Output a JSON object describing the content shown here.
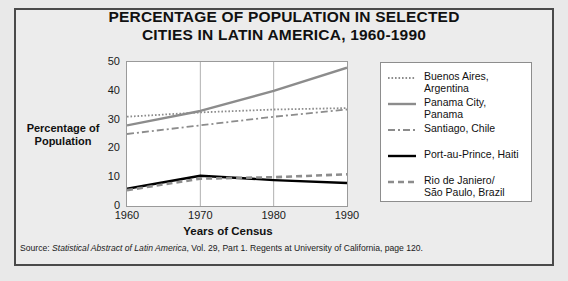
{
  "title": {
    "line1": "PERCENTAGE OF POPULATION IN SELECTED",
    "line2": "CITIES IN LATIN AMERICA, 1960-1990"
  },
  "axes": {
    "ylabel_line1": "Percentage of",
    "ylabel_line2": "Population",
    "xlabel": "Years of Census",
    "yticks": [
      "0",
      "10",
      "20",
      "30",
      "40",
      "50"
    ],
    "xticks": [
      "1960",
      "1970",
      "1980",
      "1990"
    ]
  },
  "legend": {
    "items": [
      {
        "label": "Buenos Aires, Argentina",
        "style": "dotted",
        "color": "#8c8c8c"
      },
      {
        "label": "Panama City, Panama",
        "style": "solid",
        "color": "#8c8c8c"
      },
      {
        "label": "Santiago, Chile",
        "style": "dashdot",
        "color": "#8c8c8c"
      },
      {
        "label": "Port-au-Prince, Haiti",
        "style": "solid",
        "color": "#000000"
      },
      {
        "label": "Rio de Janiero/\nSão Paulo, Brazil",
        "style": "dashed",
        "color": "#8c8c8c"
      }
    ]
  },
  "source": {
    "prefix": "Source: ",
    "italic": "Statistical Abstract of Latin America",
    "suffix": ", Vol. 29, Part 1. Regents at University of California, page 120."
  },
  "chart_data": {
    "type": "line",
    "title": "PERCENTAGE OF POPULATION IN SELECTED CITIES IN LATIN AMERICA, 1960-1990",
    "xlabel": "Years of Census",
    "ylabel": "Percentage of Population",
    "x": [
      1960,
      1970,
      1980,
      1990
    ],
    "xlim": [
      1960,
      1990
    ],
    "ylim": [
      0,
      50
    ],
    "yticks": [
      0,
      10,
      20,
      30,
      40,
      50
    ],
    "grid": "vertical",
    "legend_position": "right",
    "series": [
      {
        "name": "Buenos Aires, Argentina",
        "values": [
          31,
          32.5,
          33.5,
          34
        ],
        "style": "dotted",
        "color": "#8c8c8c"
      },
      {
        "name": "Panama City, Panama",
        "values": [
          28,
          33,
          40,
          48
        ],
        "style": "solid",
        "color": "#8c8c8c"
      },
      {
        "name": "Santiago, Chile",
        "values": [
          25,
          28,
          31,
          33.5
        ],
        "style": "dashdot",
        "color": "#8c8c8c"
      },
      {
        "name": "Port-au-Prince, Haiti",
        "values": [
          6,
          10.5,
          9,
          8
        ],
        "style": "solid",
        "color": "#000000"
      },
      {
        "name": "Rio de Janiero/São Paulo, Brazil",
        "values": [
          5.5,
          9.5,
          10,
          11
        ],
        "style": "dashed",
        "color": "#8c8c8c"
      }
    ]
  }
}
